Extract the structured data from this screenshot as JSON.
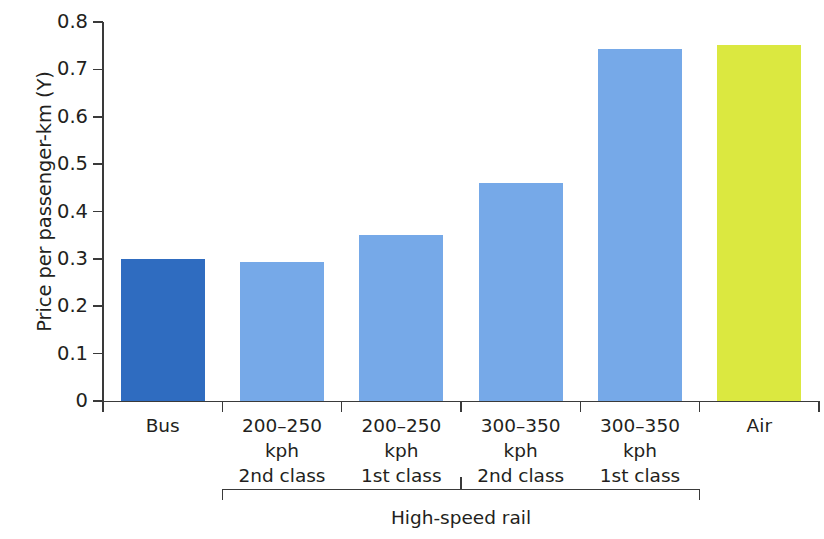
{
  "chart_data": {
    "type": "bar",
    "title": "",
    "xlabel": "",
    "ylabel": "Price per passenger-km (Y)",
    "ylim": [
      0,
      0.8
    ],
    "ytick_labels": [
      "0",
      "0.1",
      "0.2",
      "0.3",
      "0.4",
      "0.5",
      "0.6",
      "0.7",
      "0.8"
    ],
    "ytick_values": [
      0,
      0.1,
      0.2,
      0.3,
      0.4,
      0.5,
      0.6,
      0.7,
      0.8
    ],
    "grid": false,
    "legend": "none",
    "categories": [
      "Bus",
      "200–250\nkph\n2nd class",
      "200–250\nkph\n1st class",
      "300–350\nkph\n2nd class",
      "300–350\nkph\n1st class",
      "Air"
    ],
    "values": [
      0.3,
      0.293,
      0.35,
      0.46,
      0.742,
      0.752
    ],
    "bar_colors": [
      "#2f6cc0",
      "#76a9e8",
      "#76a9e8",
      "#76a9e8",
      "#76a9e8",
      "#dbe840"
    ],
    "group_bracket": {
      "label": "High-speed rail",
      "covers": [
        1,
        2,
        3,
        4
      ]
    }
  },
  "colors": {
    "bus_blue": "#2f6cc0",
    "rail_blue": "#76a9e8",
    "air_yellow": "#dbe840",
    "axis": "#3a3a3a",
    "text": "#231f20",
    "background": "#ffffff"
  }
}
